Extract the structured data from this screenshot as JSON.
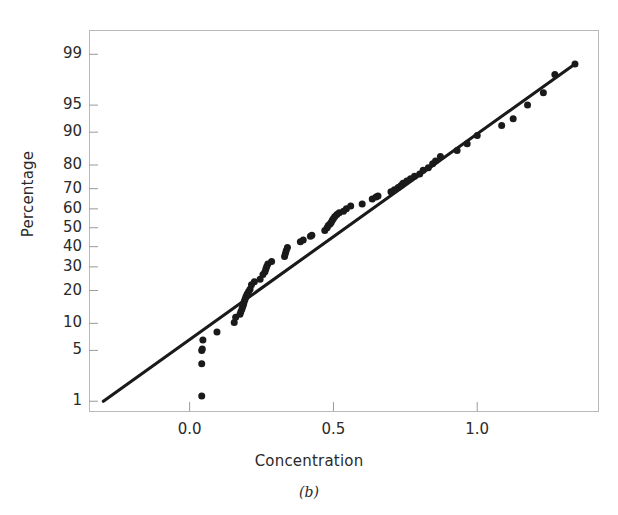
{
  "figure": {
    "caption": "(b)",
    "background": "#ffffff",
    "frame_color": "#b9b9b9",
    "ink_color": "#1a1a1a"
  },
  "chart_data": {
    "type": "scatter",
    "title": "",
    "subtitle": "",
    "caption": "(b)",
    "xlabel": "Concentration",
    "ylabel": "Percentage",
    "grid": false,
    "legend": null,
    "yscale": "normal-probability",
    "xlim": [
      -0.35,
      1.42
    ],
    "ylim": [
      0.7,
      99.6
    ],
    "xticks": [
      0.0,
      0.5,
      1.0
    ],
    "xtick_labels": [
      "0.0",
      "0.5",
      "1.0"
    ],
    "yticks": [
      1,
      5,
      10,
      20,
      30,
      40,
      50,
      60,
      70,
      80,
      90,
      95,
      99
    ],
    "ytick_labels": [
      "1",
      "5",
      "10",
      "20",
      "30",
      "40",
      "50",
      "60",
      "70",
      "80",
      "90",
      "95",
      "99"
    ],
    "annotations": [],
    "series": [
      {
        "name": "Reference line",
        "type": "line",
        "x": [
          -0.3,
          1.34
        ],
        "y": [
          1.0,
          98.6
        ]
      },
      {
        "name": "Concentration quantiles",
        "type": "scatter",
        "marker": "filled-circle",
        "x": [
          0.042,
          0.042,
          0.042,
          0.044,
          0.046,
          0.095,
          0.155,
          0.16,
          0.175,
          0.178,
          0.182,
          0.185,
          0.188,
          0.19,
          0.193,
          0.196,
          0.2,
          0.205,
          0.21,
          0.215,
          0.225,
          0.245,
          0.255,
          0.262,
          0.265,
          0.268,
          0.272,
          0.285,
          0.33,
          0.333,
          0.336,
          0.34,
          0.385,
          0.395,
          0.42,
          0.425,
          0.47,
          0.478,
          0.482,
          0.488,
          0.492,
          0.496,
          0.5,
          0.505,
          0.512,
          0.52,
          0.535,
          0.545,
          0.56,
          0.6,
          0.635,
          0.648,
          0.655,
          0.7,
          0.712,
          0.725,
          0.735,
          0.742,
          0.755,
          0.768,
          0.782,
          0.8,
          0.812,
          0.83,
          0.845,
          0.855,
          0.872,
          0.93,
          0.965,
          1.0,
          1.085,
          1.125,
          1.175,
          1.23,
          1.27,
          1.34
        ],
        "y": [
          1.2,
          3.4,
          5.0,
          5.2,
          6.6,
          8.1,
          10.2,
          11.5,
          12.3,
          13.0,
          13.8,
          14.6,
          15.4,
          16.2,
          17.0,
          17.8,
          18.7,
          19.6,
          20.5,
          22.2,
          23.5,
          24.5,
          26.5,
          27.8,
          29.0,
          30.2,
          31.3,
          32.6,
          35.0,
          36.5,
          38.0,
          39.5,
          42.5,
          43.5,
          45.5,
          46.0,
          48.5,
          50.0,
          51.2,
          52.0,
          52.8,
          54.0,
          55.0,
          56.0,
          57.0,
          58.0,
          58.8,
          60.0,
          61.5,
          62.5,
          65.0,
          66.0,
          66.5,
          68.5,
          69.5,
          70.5,
          71.5,
          72.5,
          73.5,
          74.5,
          75.5,
          76.5,
          78.0,
          79.0,
          80.5,
          81.5,
          83.0,
          85.0,
          87.0,
          89.2,
          91.5,
          92.8,
          95.0,
          96.5,
          98.0,
          98.6
        ]
      }
    ]
  },
  "plot_geometry": {
    "left": 89,
    "right": 598,
    "top": 30,
    "bottom": 411
  }
}
